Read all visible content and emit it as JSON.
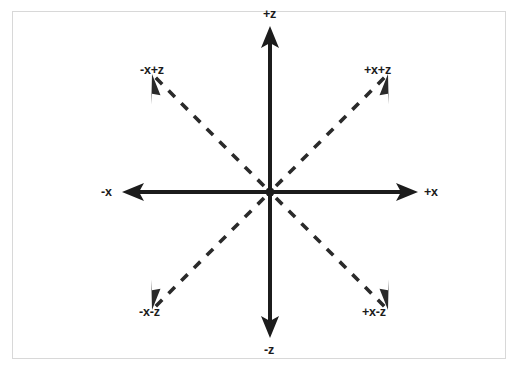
{
  "figure": {
    "background_color": "#ffffff",
    "frame_color": "#d8d8d8",
    "stroke_color": "#1c1c1c",
    "origin": {
      "x": 270,
      "y": 192,
      "dot_radius": 4
    }
  },
  "axes": [
    {
      "id": "pos-z",
      "label": "+z",
      "style": "solid",
      "direction": "up",
      "angle_deg": 90,
      "tip": {
        "x": 270,
        "y": 26
      },
      "label_pos": {
        "x": 263,
        "y": 8
      }
    },
    {
      "id": "neg-z",
      "label": "-z",
      "style": "solid",
      "direction": "down",
      "angle_deg": 270,
      "tip": {
        "x": 270,
        "y": 338
      },
      "label_pos": {
        "x": 264,
        "y": 344
      }
    },
    {
      "id": "pos-x",
      "label": "+x",
      "style": "solid",
      "direction": "right",
      "angle_deg": 0,
      "tip": {
        "x": 418,
        "y": 192
      },
      "label_pos": {
        "x": 424,
        "y": 186
      }
    },
    {
      "id": "neg-x",
      "label": "-x",
      "style": "solid",
      "direction": "left",
      "angle_deg": 180,
      "tip": {
        "x": 122,
        "y": 192
      },
      "label_pos": {
        "x": 101,
        "y": 186
      }
    },
    {
      "id": "pos-x-pos-z",
      "label": "+x+z",
      "style": "dashed",
      "direction": "up-right",
      "angle_deg": 45,
      "tip": {
        "x": 377,
        "y": 85
      },
      "label_pos": {
        "x": 364,
        "y": 64
      }
    },
    {
      "id": "neg-x-pos-z",
      "label": "-x+z",
      "style": "dashed",
      "direction": "up-left",
      "angle_deg": 135,
      "tip": {
        "x": 163,
        "y": 85
      },
      "label_pos": {
        "x": 140,
        "y": 64
      }
    },
    {
      "id": "neg-x-neg-z",
      "label": "-x-z",
      "style": "dashed",
      "direction": "down-left",
      "angle_deg": 225,
      "tip": {
        "x": 163,
        "y": 299
      },
      "label_pos": {
        "x": 139,
        "y": 306
      }
    },
    {
      "id": "pos-x-neg-z",
      "label": "+x-z",
      "style": "dashed",
      "direction": "down-right",
      "angle_deg": 315,
      "tip": {
        "x": 377,
        "y": 299
      },
      "label_pos": {
        "x": 362,
        "y": 306
      }
    }
  ]
}
